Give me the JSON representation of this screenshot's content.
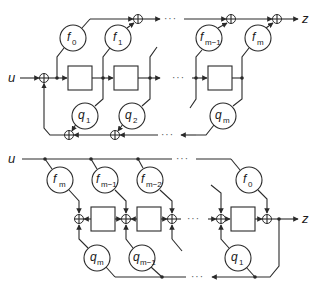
{
  "diagram": {
    "type": "signal-flow",
    "top": {
      "input_label": "u",
      "output_label": "z",
      "ellipsis": "···",
      "feedforward_gains": [
        {
          "base": "f",
          "sub": "0"
        },
        {
          "base": "f",
          "sub": "1"
        },
        {
          "base": "f",
          "sub": "m−1"
        },
        {
          "base": "f",
          "sub": "m"
        }
      ],
      "feedback_gains": [
        {
          "base": "q",
          "sub": "1"
        },
        {
          "base": "q",
          "sub": "2"
        },
        {
          "base": "q",
          "sub": "m"
        }
      ]
    },
    "bottom": {
      "input_label": "u",
      "output_label": "z",
      "ellipsis": "···",
      "feedforward_gains": [
        {
          "base": "f",
          "sub": "m"
        },
        {
          "base": "f",
          "sub": "m−1"
        },
        {
          "base": "f",
          "sub": "m−2"
        },
        {
          "base": "f",
          "sub": "0"
        }
      ],
      "feedback_gains": [
        {
          "base": "q",
          "sub": "m"
        },
        {
          "base": "q",
          "sub": "m−1"
        },
        {
          "base": "q",
          "sub": "1"
        }
      ]
    },
    "colors": {
      "stroke": "#2a2a2a",
      "background": "#ffffff"
    }
  }
}
